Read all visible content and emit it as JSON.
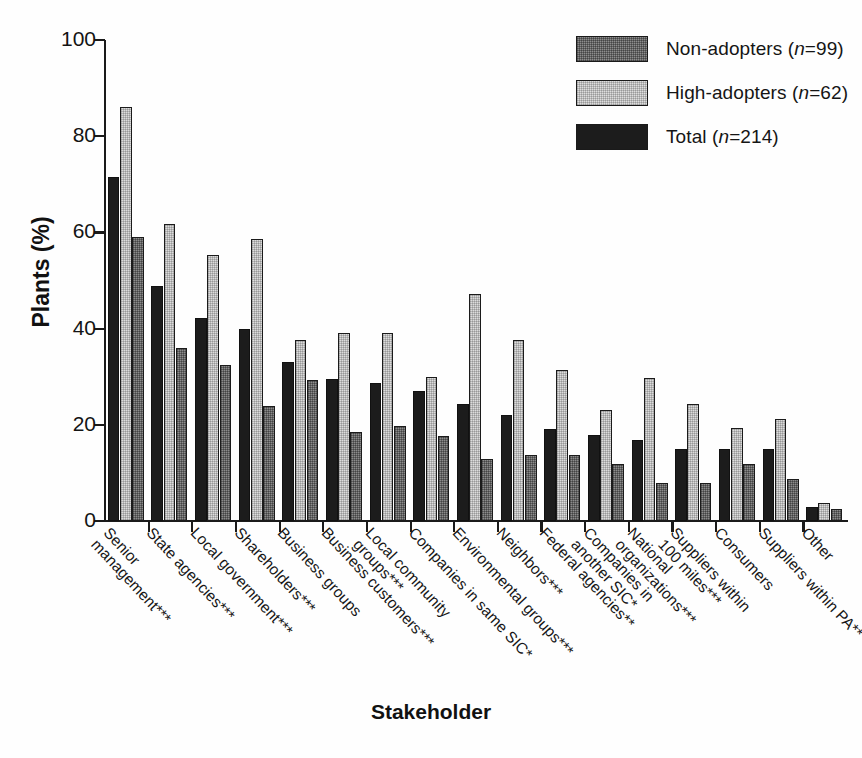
{
  "chart_data": {
    "type": "bar",
    "title": "",
    "xlabel": "Stakeholder",
    "ylabel": "Plants (%)",
    "ylim": [
      0,
      100
    ],
    "yticks": [
      0,
      20,
      40,
      60,
      80,
      100
    ],
    "grid": false,
    "legend_position": "top-right",
    "categories": [
      "Senior management***",
      "State agencies***",
      "Local government***",
      "Shareholders***",
      "Business groups",
      "Business customers***",
      "Local community groups***",
      "Companies in same SIC*",
      "Environmental groups***",
      "Neighbors***",
      "Federal agencies**",
      "Companies in another SIC*",
      "National organizations***",
      "Suppliers within 100 miles***",
      "Consumers",
      "Suppliers within PA**",
      "Other"
    ],
    "category_lines": [
      [
        "Senior",
        "management***"
      ],
      [
        "State agencies***"
      ],
      [
        "Local government***"
      ],
      [
        "Shareholders***"
      ],
      [
        "Business groups"
      ],
      [
        "Business customers***"
      ],
      [
        "Local community",
        "groups***"
      ],
      [
        "Companies in same SIC*"
      ],
      [
        "Environmental groups***"
      ],
      [
        "Neighbors***"
      ],
      [
        "Federal agencies**"
      ],
      [
        "Companies in",
        "another SIC*"
      ],
      [
        "National",
        "organizations***"
      ],
      [
        "Suppliers within",
        "100 miles***"
      ],
      [
        "Consumers"
      ],
      [
        "Suppliers within PA**"
      ],
      [
        "Other"
      ]
    ],
    "series": [
      {
        "name": "Total (n=214)",
        "key": "total",
        "color": "#1c1c1c",
        "values": [
          71.5,
          48.8,
          42.2,
          40.0,
          33.0,
          29.5,
          28.6,
          27.0,
          24.3,
          22.0,
          19.2,
          17.8,
          16.8,
          15.0,
          15.0,
          15.0,
          3.0
        ]
      },
      {
        "name": "High-adopters (n=62)",
        "key": "high",
        "color": "#dcdcdc",
        "values": [
          86.0,
          61.8,
          55.4,
          58.6,
          37.6,
          39.0,
          39.0,
          30.0,
          47.2,
          37.6,
          31.4,
          23.0,
          29.8,
          24.4,
          19.4,
          21.2,
          3.8
        ]
      },
      {
        "name": "Non-adopters (n=99)",
        "key": "non",
        "color": "#8c8c8c",
        "values": [
          59.0,
          36.0,
          32.4,
          24.0,
          29.4,
          18.6,
          19.7,
          17.6,
          12.8,
          13.8,
          13.8,
          11.8,
          8.0,
          8.0,
          11.8,
          8.8,
          2.4
        ]
      }
    ],
    "bar_order": [
      "total",
      "high",
      "non"
    ]
  },
  "legend": {
    "items": [
      {
        "label_text": "Non-adopters (",
        "n_prefix": "n",
        "n_value": "=99)",
        "swatch": "sw-non",
        "full": "Non-adopters (n=99)"
      },
      {
        "label_text": "High-adopters (",
        "n_prefix": "n",
        "n_value": "=62)",
        "swatch": "sw-high",
        "full": "High-adopters (n=62)"
      },
      {
        "label_text": "Total (",
        "n_prefix": "n",
        "n_value": "=214)",
        "swatch": "sw-total",
        "full": "Total (n=214)"
      }
    ]
  },
  "axes": {
    "y_title": "Plants (%)",
    "x_title": "Stakeholder"
  }
}
